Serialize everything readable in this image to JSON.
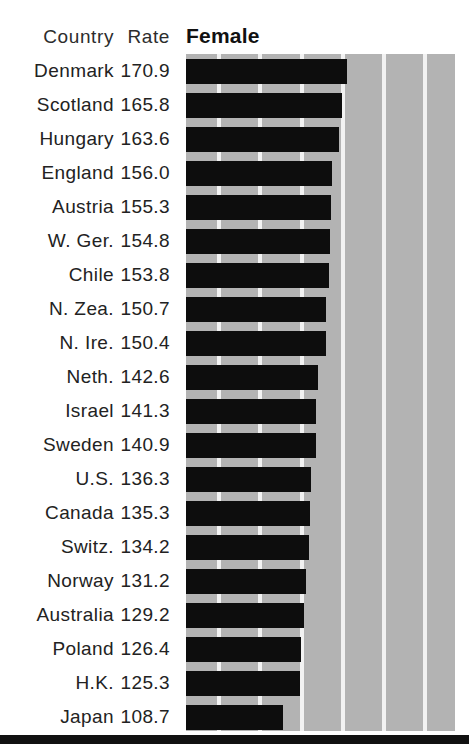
{
  "table": {
    "columns": [
      "Country",
      "Rate"
    ],
    "series_header": "Female"
  },
  "chart_data": {
    "type": "bar",
    "orientation": "horizontal",
    "title": "Female",
    "xlabel": "",
    "ylabel": "Country",
    "value_label": "Rate",
    "grid": true,
    "gridlines_x": [
      45,
      85,
      125,
      165,
      205,
      245
    ],
    "xlim": [
      0,
      250
    ],
    "legend": [],
    "categories": [
      "Denmark",
      "Scotland",
      "Hungary",
      "England",
      "Austria",
      "W. Ger.",
      "Chile",
      "N. Zea.",
      "N. Ire.",
      "Neth.",
      "Israel",
      "Sweden",
      "U.S.",
      "Canada",
      "Switz.",
      "Norway",
      "Australia",
      "Poland",
      "H.K.",
      "Japan"
    ],
    "values": [
      170.9,
      165.8,
      163.6,
      156.0,
      155.3,
      154.8,
      153.8,
      150.7,
      150.4,
      142.6,
      141.3,
      140.9,
      136.3,
      135.3,
      134.2,
      131.2,
      129.2,
      126.4,
      125.3,
      108.7
    ],
    "value_labels": [
      "170.9",
      "165.8",
      "163.6",
      "156.0",
      "155.3",
      "154.8",
      "153.8",
      "150.7",
      "150.4",
      "142.6",
      "141.3",
      "140.9",
      "136.3",
      "135.3",
      "134.2",
      "131.2",
      "129.2",
      "126.4",
      "125.3",
      "108.7"
    ],
    "rows": [
      {
        "country": "Denmark",
        "rate": "170.9",
        "value": 170.9
      },
      {
        "country": "Scotland",
        "rate": "165.8",
        "value": 165.8
      },
      {
        "country": "Hungary",
        "rate": "163.6",
        "value": 163.6
      },
      {
        "country": "England",
        "rate": "156.0",
        "value": 156.0
      },
      {
        "country": "Austria",
        "rate": "155.3",
        "value": 155.3
      },
      {
        "country": "W. Ger.",
        "rate": "154.8",
        "value": 154.8
      },
      {
        "country": "Chile",
        "rate": "153.8",
        "value": 153.8
      },
      {
        "country": "N. Zea.",
        "rate": "150.7",
        "value": 150.7
      },
      {
        "country": "N. Ire.",
        "rate": "150.4",
        "value": 150.4
      },
      {
        "country": "Neth.",
        "rate": "142.6",
        "value": 142.6
      },
      {
        "country": "Israel",
        "rate": "141.3",
        "value": 141.3
      },
      {
        "country": "Sweden",
        "rate": "140.9",
        "value": 140.9
      },
      {
        "country": "U.S.",
        "rate": "136.3",
        "value": 136.3
      },
      {
        "country": "Canada",
        "rate": "135.3",
        "value": 135.3
      },
      {
        "country": "Switz.",
        "rate": "134.2",
        "value": 134.2
      },
      {
        "country": "Norway",
        "rate": "131.2",
        "value": 131.2
      },
      {
        "country": "Australia",
        "rate": "129.2",
        "value": 129.2
      },
      {
        "country": "Poland",
        "rate": "126.4",
        "value": 126.4
      },
      {
        "country": "H.K.",
        "rate": "125.3",
        "value": 125.3
      },
      {
        "country": "Japan",
        "rate": "108.7",
        "value": 108.7
      }
    ]
  },
  "colors": {
    "bar": "#0d0d0d",
    "panel": "#b3b3b3",
    "gridline": "#f2f2f2",
    "text": "#222222",
    "rule": "#111111",
    "background": "#ffffff"
  }
}
